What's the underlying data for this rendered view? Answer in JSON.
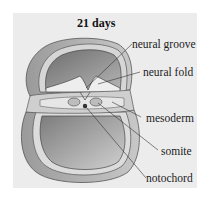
{
  "figure": {
    "title": "21 days",
    "labels": [
      {
        "id": "neural-groove",
        "text": "neural groove"
      },
      {
        "id": "neural-fold",
        "text": "neural fold"
      },
      {
        "id": "mesoderm",
        "text": "mesoderm"
      },
      {
        "id": "somite",
        "text": "somite"
      },
      {
        "id": "notochord",
        "text": "notochord"
      }
    ],
    "colors": {
      "panel": "#ececec",
      "outer_layer": "#a8a8a8",
      "inner_cavity": "#8a8a8a",
      "ectoderm_band": "#dcdcdc",
      "leader_line": "#333333"
    }
  }
}
